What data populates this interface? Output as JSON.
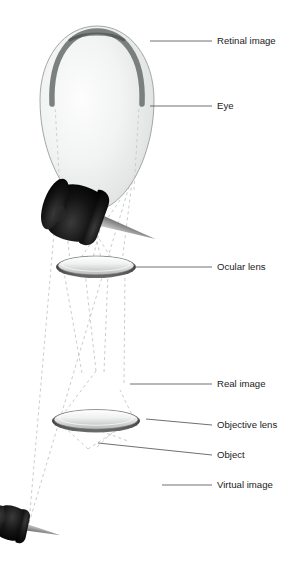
{
  "figure": {
    "background_color": "#ffffff",
    "width": 304,
    "height": 578
  },
  "labels": [
    {
      "id": "retinal-image",
      "text": "Retinal image",
      "x": 217,
      "y": 41,
      "leader": {
        "x1": 150,
        "y1": 41,
        "x2": 212,
        "y2": 41
      }
    },
    {
      "id": "eye",
      "text": "Eye",
      "x": 217,
      "y": 106,
      "leader": {
        "x1": 150,
        "y1": 106,
        "x2": 212,
        "y2": 106
      }
    },
    {
      "id": "ocular-lens",
      "text": "Ocular lens",
      "x": 217,
      "y": 267,
      "leader": {
        "x1": 135,
        "y1": 267,
        "x2": 212,
        "y2": 267
      }
    },
    {
      "id": "real-image",
      "text": "Real image",
      "x": 217,
      "y": 384,
      "leader": {
        "x1": 130,
        "y1": 384,
        "x2": 212,
        "y2": 384
      }
    },
    {
      "id": "objective-lens",
      "text": "Objective lens",
      "x": 217,
      "y": 425,
      "leader": {
        "x1": 145,
        "y1": 418,
        "x2": 212,
        "y2": 425
      }
    },
    {
      "id": "object",
      "text": "Object",
      "x": 217,
      "y": 455,
      "leader": {
        "x1": 100,
        "y1": 443,
        "x2": 212,
        "y2": 455
      }
    },
    {
      "id": "virtual-image",
      "text": "Virtual image",
      "x": 217,
      "y": 485,
      "leader": {
        "x1": 160,
        "y1": 485,
        "x2": 212,
        "y2": 485
      }
    }
  ],
  "elements": {
    "eye": {
      "name": "eye",
      "shape": "egg",
      "center_x": 97,
      "center_y": 118,
      "radius_x": 57,
      "radius_y": 92,
      "fill_light": "#fbfbfb",
      "fill_mid": "#e7e9e8",
      "fill_edge": "#c9cdcc",
      "outline_color": "#8f9593"
    },
    "retina_arc": {
      "name": "retinal-image-arc",
      "color": "#6e7472",
      "stroke_width": 5.5
    },
    "ocular_lens": {
      "name": "ocular-lens",
      "center_x": 96,
      "center_y": 266,
      "radius_x": 40,
      "radius_y": 11,
      "rim_color": "#4a4a4a",
      "glass_top": "#ffffff",
      "glass_bottom": "#b9bcbb"
    },
    "objective_lens": {
      "name": "objective-lens",
      "center_x": 96,
      "center_y": 420,
      "radius_x": 44,
      "radius_y": 11,
      "rim_color": "#4a4a4a",
      "glass_top": "#ffffff",
      "glass_bottom": "#b9bcbb"
    },
    "real_image_pin": {
      "name": "real-image-pushpin",
      "center_x": 104,
      "center_y": 378,
      "scale": 0.55,
      "rotation": -205,
      "head_color": "#111111",
      "needle_color": "#9b9b9b"
    },
    "object_pin": {
      "name": "object-pushpin",
      "center_x": 86,
      "center_y": 450,
      "scale": 0.33,
      "rotation": 8,
      "head_color": "#111111",
      "needle_color": "#9b9b9b"
    },
    "virtual_image_pin": {
      "name": "virtual-image-pushpin",
      "center_x": 108,
      "center_y": 495,
      "scale": 1.0,
      "rotation": 22,
      "head_color": "#111111",
      "needle_color": "#9b9b9b"
    }
  },
  "rays": {
    "color": "#b4b4b4",
    "dash": "3 3",
    "stroke_width": 0.7,
    "outer_cone": {
      "apex_x": 29,
      "apex_y": 523,
      "top_left_x": 60,
      "top_left_y": 163,
      "top_right_x": 135,
      "top_right_y": 163
    },
    "description": "Dashed light-ray cones from object through objective lens, forming real image, then through ocular lens into the eye forming the retinal image; outer dashed cone extends downward to the virtual image apex."
  }
}
